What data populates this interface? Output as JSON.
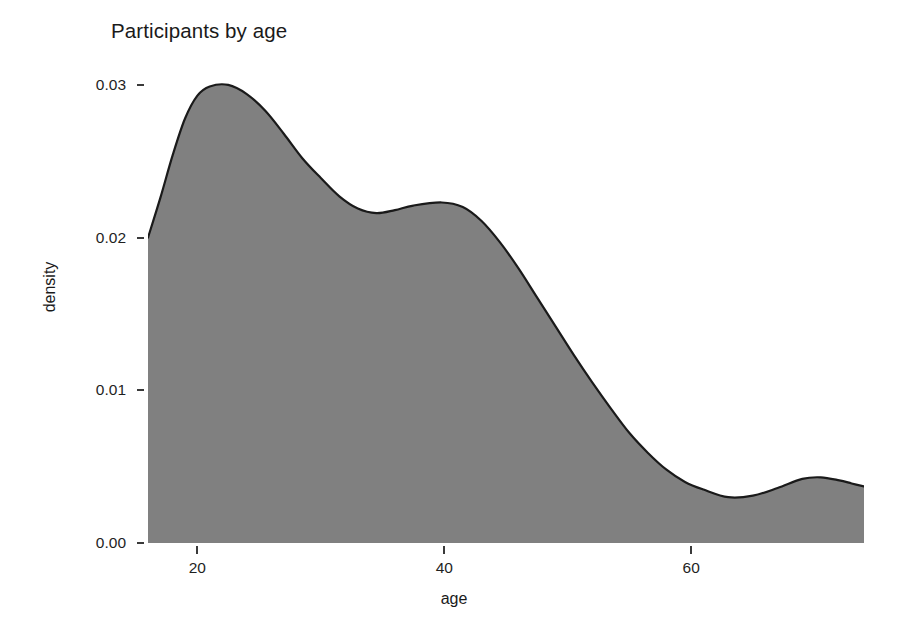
{
  "chart_data": {
    "type": "area",
    "title": "Participants by age",
    "xlabel": "age",
    "ylabel": "density",
    "grid": false,
    "legend": null,
    "xlim": [
      16,
      74
    ],
    "ylim": [
      0,
      0.0315
    ],
    "xticks": [
      20,
      40,
      60
    ],
    "xtick_labels": [
      "20",
      "40",
      "60"
    ],
    "yticks": [
      0.0,
      0.01,
      0.02,
      0.03
    ],
    "ytick_labels": [
      "0.00",
      "0.01",
      "0.02",
      "0.03"
    ],
    "fill_color": "#808080",
    "line_color": "#1a1a1a",
    "background_color": "#ffffff",
    "series": [
      {
        "name": "density",
        "x": [
          16.0,
          17.0,
          18.0,
          19.0,
          20.0,
          21.0,
          22.5,
          24.0,
          25.5,
          27.0,
          28.5,
          30.0,
          31.5,
          33.0,
          34.5,
          36.0,
          37.5,
          39.8,
          41.5,
          43.0,
          44.5,
          46.0,
          47.5,
          49.0,
          50.5,
          52.0,
          53.5,
          55.0,
          56.5,
          58.0,
          59.5,
          61.0,
          63.0,
          65.0,
          67.0,
          69.0,
          70.5,
          72.0,
          73.0,
          74.0
        ],
        "y": [
          0.02,
          0.0226,
          0.0254,
          0.0278,
          0.0293,
          0.0299,
          0.03,
          0.0294,
          0.0283,
          0.0268,
          0.0252,
          0.0239,
          0.0227,
          0.0219,
          0.0216,
          0.0218,
          0.0221,
          0.0223,
          0.022,
          0.0211,
          0.0197,
          0.018,
          0.0161,
          0.0142,
          0.0123,
          0.0105,
          0.0088,
          0.0072,
          0.0059,
          0.0048,
          0.004,
          0.0035,
          0.003,
          0.0031,
          0.0036,
          0.0042,
          0.0043,
          0.0041,
          0.0039,
          0.0037
        ]
      }
    ],
    "peaks": [
      {
        "label": "primary mode",
        "x": 22.5,
        "y": 0.03
      },
      {
        "label": "secondary mode",
        "x": 39.8,
        "y": 0.0223
      },
      {
        "label": "tail bump",
        "x": 70.5,
        "y": 0.0043
      }
    ],
    "valleys": [
      {
        "label": "mid valley",
        "x": 34.5,
        "y": 0.0216
      },
      {
        "label": "tail valley",
        "x": 63.0,
        "y": 0.003
      }
    ]
  }
}
